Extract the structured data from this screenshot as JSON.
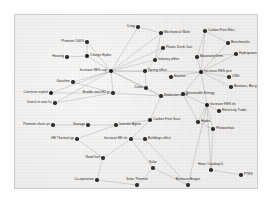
{
  "figure": {
    "kind": "network-graph",
    "title": "",
    "background_color": "#efeeec",
    "border_color": "#cfcdc9",
    "node_color": "#2f2f2f",
    "edge_color": "#9a9a9a",
    "label_color": "#1d1d1d"
  },
  "graph": {
    "node_count": 42,
    "edge_count": 58,
    "nodes": [
      {
        "id": "craig",
        "label": "Craig",
        "x": 123,
        "y": 12,
        "anchor": "right",
        "size": "normal"
      },
      {
        "id": "mechanical-work",
        "label": "Mechanical Work",
        "x": 146,
        "y": 18,
        "anchor": "left",
        "size": "normal"
      },
      {
        "id": "carbon-free-elec",
        "label": "Carbon Free Elec.",
        "x": 190,
        "y": 16,
        "anchor": "left",
        "size": "normal"
      },
      {
        "id": "promote-100",
        "label": "Promote 100%",
        "x": 72,
        "y": 27,
        "anchor": "right",
        "size": "normal"
      },
      {
        "id": "plastic-drink-can",
        "label": "Plastic Drink Can",
        "x": 148,
        "y": 33,
        "anchor": "left",
        "size": "normal"
      },
      {
        "id": "benchmarks",
        "label": "Benchmarks",
        "x": 213,
        "y": 28,
        "anchor": "left",
        "size": "normal"
      },
      {
        "id": "heating",
        "label": "Heating",
        "x": 52,
        "y": 42,
        "anchor": "right",
        "size": "normal"
      },
      {
        "id": "charge-hydro",
        "label": "Charge Hydro",
        "x": 72,
        "y": 41,
        "anchor": "left",
        "size": "big"
      },
      {
        "id": "industry-office",
        "label": "Industry office",
        "x": 140,
        "y": 45,
        "anchor": "left",
        "size": "normal"
      },
      {
        "id": "electricity-dem",
        "label": "Electricity Dem.",
        "x": 182,
        "y": 42,
        "anchor": "left",
        "size": "normal"
      },
      {
        "id": "hydropower",
        "label": "Hydropower",
        "x": 221,
        "y": 39,
        "anchor": "left",
        "size": "normal"
      },
      {
        "id": "increase-res-cap",
        "label": "Increase RES cap.",
        "x": 96,
        "y": 56,
        "anchor": "right",
        "size": "big"
      },
      {
        "id": "spring-office",
        "label": "Spring office",
        "x": 130,
        "y": 56,
        "anchor": "left",
        "size": "normal"
      },
      {
        "id": "increase-res-pen",
        "label": "Increase RES pen.",
        "x": 186,
        "y": 57,
        "anchor": "left",
        "size": "big"
      },
      {
        "id": "gasoline",
        "label": "Gasoline",
        "x": 58,
        "y": 67,
        "anchor": "right",
        "size": "normal"
      },
      {
        "id": "cng",
        "label": "CNG",
        "x": 214,
        "y": 62,
        "anchor": "left",
        "size": "normal"
      },
      {
        "id": "continue-exploit",
        "label": "Continue exploit",
        "x": 36,
        "y": 78,
        "anchor": "right",
        "size": "big"
      },
      {
        "id": "enable-own-hc",
        "label": "Enable own HC p.",
        "x": 98,
        "y": 78,
        "anchor": "right",
        "size": "normal"
      },
      {
        "id": "costs",
        "label": "Costs",
        "x": 131,
        "y": 73,
        "anchor": "right",
        "size": "normal"
      },
      {
        "id": "reduction-of-ff",
        "label": "Reduction of FF",
        "x": 146,
        "y": 81,
        "anchor": "left",
        "size": "normal"
      },
      {
        "id": "renewable-energy",
        "label": "Renewable Energy",
        "x": 168,
        "y": 79,
        "anchor": "left",
        "size": "normal"
      },
      {
        "id": "biomass-bio-gas",
        "label": "Biomass, Bio gas",
        "x": 216,
        "y": 72,
        "anchor": "left",
        "size": "normal"
      },
      {
        "id": "invest-in-new-fu",
        "label": "Invest in new fu.",
        "x": 40,
        "y": 88,
        "anchor": "right",
        "size": "normal"
      },
      {
        "id": "increase-res-sh",
        "label": "Increase RES sh.",
        "x": 192,
        "y": 90,
        "anchor": "left",
        "size": "big"
      },
      {
        "id": "electricity-trade",
        "label": "Electricity Trade",
        "x": 204,
        "y": 96,
        "anchor": "left",
        "size": "normal"
      },
      {
        "id": "promote-share-pv",
        "label": "Promote share pv",
        "x": 38,
        "y": 110,
        "anchor": "right",
        "size": "normal"
      },
      {
        "id": "storage",
        "label": "Storage",
        "x": 73,
        "y": 110,
        "anchor": "right",
        "size": "normal"
      },
      {
        "id": "investor-agree",
        "label": "Investor Agree.",
        "x": 101,
        "y": 110,
        "anchor": "left",
        "size": "normal"
      },
      {
        "id": "carbon-free-sour",
        "label": "Carbon Free Sour.",
        "x": 135,
        "y": 105,
        "anchor": "left",
        "size": "normal"
      },
      {
        "id": "hydro",
        "label": "Hydro",
        "x": 183,
        "y": 107,
        "anchor": "left",
        "size": "normal"
      },
      {
        "id": "photovoltaic",
        "label": "Photovoltaic",
        "x": 198,
        "y": 114,
        "anchor": "left",
        "size": "normal"
      },
      {
        "id": "he-thermal-pp",
        "label": "HE Thermal pp",
        "x": 62,
        "y": 124,
        "anchor": "right",
        "size": "normal"
      },
      {
        "id": "increase-ee",
        "label": "Increase EE sh.",
        "x": 116,
        "y": 124,
        "anchor": "right",
        "size": "normal"
      },
      {
        "id": "buildings-office",
        "label": "Buildings office",
        "x": 130,
        "y": 124,
        "anchor": "left",
        "size": "normal"
      },
      {
        "id": "road-fuel",
        "label": "Road fuel",
        "x": 88,
        "y": 143,
        "anchor": "right",
        "size": "normal"
      },
      {
        "id": "solar",
        "label": "Solar",
        "x": 138,
        "y": 153,
        "anchor": "center",
        "size": "normal"
      },
      {
        "id": "heat-cooling-d",
        "label": "Heat / Cooling D.",
        "x": 196,
        "y": 155,
        "anchor": "center",
        "size": "normal"
      },
      {
        "id": "ptes",
        "label": "PTES",
        "x": 226,
        "y": 160,
        "anchor": "left",
        "size": "normal"
      },
      {
        "id": "co-operation",
        "label": "Co-operation",
        "x": 82,
        "y": 165,
        "anchor": "right",
        "size": "normal"
      },
      {
        "id": "solar-thermal",
        "label": "Solar Thermal",
        "x": 122,
        "y": 170,
        "anchor": "center",
        "size": "normal"
      },
      {
        "id": "biomass-biogas",
        "label": "Biomass Biogas",
        "x": 173,
        "y": 170,
        "anchor": "center",
        "size": "normal"
      },
      {
        "id": "nuclear",
        "label": "Nuclear",
        "x": 156,
        "y": 62,
        "anchor": "left",
        "size": "normal"
      }
    ],
    "edges": [
      [
        "craig",
        "increase-res-cap"
      ],
      [
        "craig",
        "mechanical-work"
      ],
      [
        "mechanical-work",
        "increase-res-cap"
      ],
      [
        "mechanical-work",
        "industry-office"
      ],
      [
        "carbon-free-elec",
        "increase-res-pen"
      ],
      [
        "carbon-free-elec",
        "electricity-dem"
      ],
      [
        "carbon-free-elec",
        "benchmarks"
      ],
      [
        "benchmarks",
        "increase-res-pen"
      ],
      [
        "promote-100",
        "increase-res-cap"
      ],
      [
        "promote-100",
        "charge-hydro"
      ],
      [
        "plastic-drink-can",
        "increase-res-cap"
      ],
      [
        "plastic-drink-can",
        "industry-office"
      ],
      [
        "heating",
        "charge-hydro"
      ],
      [
        "charge-hydro",
        "increase-res-cap"
      ],
      [
        "industry-office",
        "increase-res-cap"
      ],
      [
        "industry-office",
        "spring-office"
      ],
      [
        "electricity-dem",
        "increase-res-pen"
      ],
      [
        "electricity-dem",
        "hydropower"
      ],
      [
        "hydropower",
        "increase-res-pen"
      ],
      [
        "increase-res-cap",
        "spring-office"
      ],
      [
        "increase-res-cap",
        "enable-own-hc"
      ],
      [
        "increase-res-cap",
        "costs"
      ],
      [
        "increase-res-cap",
        "continue-exploit"
      ],
      [
        "increase-res-cap",
        "invest-in-new-fu"
      ],
      [
        "increase-res-cap",
        "gasoline"
      ],
      [
        "increase-res-cap",
        "reduction-of-ff"
      ],
      [
        "increase-res-cap",
        "increase-res-pen"
      ],
      [
        "spring-office",
        "costs"
      ],
      [
        "increase-res-pen",
        "renewable-energy"
      ],
      [
        "increase-res-pen",
        "cng"
      ],
      [
        "increase-res-pen",
        "biomass-bio-gas"
      ],
      [
        "increase-res-pen",
        "increase-res-sh"
      ],
      [
        "increase-res-pen",
        "nuclear"
      ],
      [
        "gasoline",
        "enable-own-hc"
      ],
      [
        "continue-exploit",
        "enable-own-hc"
      ],
      [
        "invest-in-new-fu",
        "enable-own-hc"
      ],
      [
        "enable-own-hc",
        "reduction-of-ff"
      ],
      [
        "costs",
        "reduction-of-ff"
      ],
      [
        "reduction-of-ff",
        "renewable-energy"
      ],
      [
        "reduction-of-ff",
        "carbon-free-sour"
      ],
      [
        "renewable-energy",
        "increase-res-sh"
      ],
      [
        "renewable-energy",
        "hydro"
      ],
      [
        "increase-res-sh",
        "electricity-trade"
      ],
      [
        "increase-res-sh",
        "photovoltaic"
      ],
      [
        "increase-res-sh",
        "hydro"
      ],
      [
        "increase-res-sh",
        "heat-cooling-d"
      ],
      [
        "increase-res-sh",
        "biomass-biogas"
      ],
      [
        "promote-share-pv",
        "storage"
      ],
      [
        "storage",
        "investor-agree"
      ],
      [
        "investor-agree",
        "carbon-free-sour"
      ],
      [
        "carbon-free-sour",
        "increase-ee"
      ],
      [
        "he-thermal-pp",
        "investor-agree"
      ],
      [
        "increase-ee",
        "buildings-office"
      ],
      [
        "increase-ee",
        "road-fuel"
      ],
      [
        "increase-ee",
        "solar"
      ],
      [
        "road-fuel",
        "co-operation"
      ],
      [
        "solar",
        "solar-thermal"
      ],
      [
        "heat-cooling-d",
        "ptes"
      ],
      [
        "buildings-office",
        "biomass-biogas"
      ],
      [
        "solar",
        "biomass-biogas"
      ],
      [
        "co-operation",
        "solar-thermal"
      ],
      [
        "he-thermal-pp",
        "road-fuel"
      ],
      [
        "photovoltaic",
        "heat-cooling-d"
      ],
      [
        "hydro",
        "photovoltaic"
      ]
    ]
  }
}
